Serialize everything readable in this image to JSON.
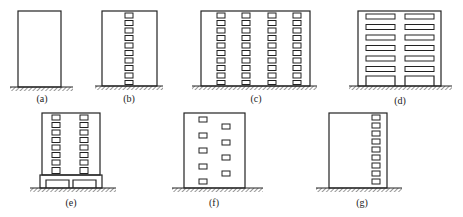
{
  "figure": {
    "panels": [
      {
        "id": "a",
        "label": "(a)",
        "description": "Plain building, no openings"
      },
      {
        "id": "b",
        "label": "(b)",
        "description": "Single central column of windows"
      },
      {
        "id": "c",
        "label": "(c)",
        "description": "Wide building with four window columns"
      },
      {
        "id": "d",
        "label": "(d)",
        "description": "Two columns of wide horizontal openings with large ground-floor openings"
      },
      {
        "id": "e",
        "label": "(e)",
        "description": "Tower with two window columns on a podium with large openings"
      },
      {
        "id": "f",
        "label": "(f)",
        "description": "Staggered windows in two columns"
      },
      {
        "id": "g",
        "label": "(g)",
        "description": "Single window column near right edge"
      }
    ]
  },
  "colors": {
    "line": "#222222",
    "background": "#ffffff"
  }
}
